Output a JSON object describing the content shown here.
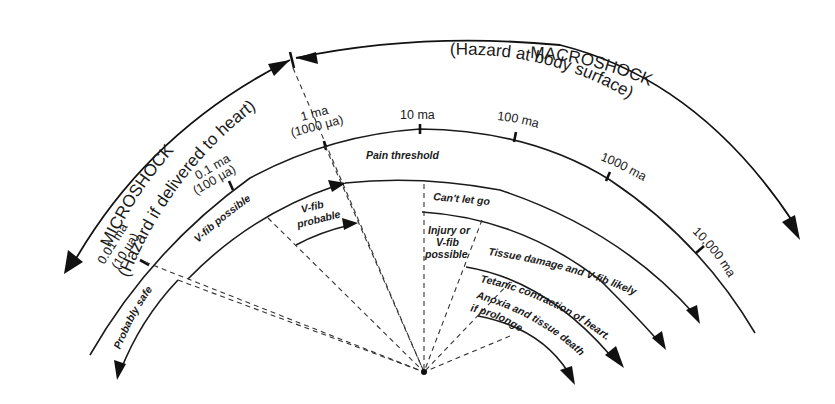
{
  "diagram": {
    "title_left": "MICROSHOCK",
    "subtitle_left": "(Hazard if delivered to heart)",
    "title_right": "MACROSHOCK",
    "subtitle_right": "(Hazard at body surface)",
    "scale": [
      {
        "ma": "0.01 ma",
        "ua": "(10 µa)"
      },
      {
        "ma": "0.1 ma",
        "ua": "(100 µa)"
      },
      {
        "ma": "1 ma",
        "ua": "(1000 µa)"
      },
      {
        "ma": "10 ma"
      },
      {
        "ma": "100 ma"
      },
      {
        "ma": "1000 ma"
      },
      {
        "ma": "10,000 ma"
      }
    ],
    "zones": {
      "probably_safe": "Probably safe",
      "vfib_possible": "V-fib possible",
      "vfib_probable_1": "V-fib",
      "vfib_probable_2": "probable",
      "pain_threshold": "Pain threshold",
      "cant_let_go": "Can't let go",
      "injury_1": "Injury or",
      "injury_2": "V-fib",
      "injury_3": "possible",
      "tissue_damage": "Tissue damage and V-fib likely",
      "tetanic": "Tetanic contraction of heart.",
      "anoxia_1": "Anoxia and tissue death",
      "anoxia_2": "if prolonged"
    },
    "colors": {
      "ink": "#1a1a1a",
      "background": "#ffffff"
    }
  }
}
